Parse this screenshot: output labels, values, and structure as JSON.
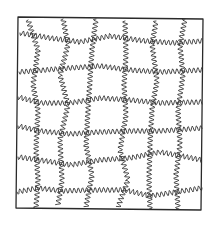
{
  "drawing": {
    "description": "Hand-drawn sketch: square frame filled with a distorted grid of wavy (squiggly) lines",
    "stroke_color": "#333333",
    "background": "#ffffff",
    "frame": {
      "points": [
        [
          18,
          17
        ],
        [
          203,
          19
        ],
        [
          201,
          210
        ],
        [
          16,
          208
        ]
      ]
    },
    "vertical_lines": [
      {
        "points": [
          [
            28,
            20
          ],
          [
            38,
            50
          ],
          [
            33,
            85
          ],
          [
            38,
            110
          ],
          [
            36,
            150
          ],
          [
            38,
            180
          ],
          [
            36,
            208
          ]
        ]
      },
      {
        "points": [
          [
            63,
            19
          ],
          [
            68,
            45
          ],
          [
            60,
            75
          ],
          [
            68,
            105
          ],
          [
            60,
            140
          ],
          [
            62,
            180
          ],
          [
            58,
            205
          ]
        ]
      },
      {
        "points": [
          [
            96,
            19
          ],
          [
            92,
            50
          ],
          [
            90,
            80
          ],
          [
            88,
            110
          ],
          [
            86,
            145
          ],
          [
            92,
            175
          ],
          [
            86,
            207
          ]
        ]
      },
      {
        "points": [
          [
            125,
            21
          ],
          [
            126,
            55
          ],
          [
            124,
            85
          ],
          [
            126,
            115
          ],
          [
            120,
            150
          ],
          [
            128,
            180
          ],
          [
            118,
            207
          ]
        ]
      },
      {
        "points": [
          [
            156,
            21
          ],
          [
            152,
            45
          ],
          [
            157,
            80
          ],
          [
            152,
            110
          ],
          [
            150,
            145
          ],
          [
            149,
            180
          ],
          [
            150,
            209
          ]
        ]
      },
      {
        "points": [
          [
            185,
            19
          ],
          [
            180,
            45
          ],
          [
            183,
            75
          ],
          [
            178,
            110
          ],
          [
            180,
            145
          ],
          [
            176,
            175
          ],
          [
            178,
            209
          ]
        ]
      }
    ],
    "horizontal_lines": [
      {
        "points": [
          [
            20,
            33
          ],
          [
            50,
            38
          ],
          [
            80,
            42
          ],
          [
            110,
            36
          ],
          [
            145,
            41
          ],
          [
            175,
            43
          ],
          [
            202,
            41
          ]
        ]
      },
      {
        "points": [
          [
            19,
            72
          ],
          [
            45,
            70
          ],
          [
            70,
            68
          ],
          [
            100,
            66
          ],
          [
            130,
            70
          ],
          [
            160,
            72
          ],
          [
            202,
            70
          ]
        ]
      },
      {
        "points": [
          [
            18,
            97
          ],
          [
            40,
            103
          ],
          [
            70,
            103
          ],
          [
            100,
            98
          ],
          [
            130,
            100
          ],
          [
            160,
            103
          ],
          [
            202,
            102
          ]
        ]
      },
      {
        "points": [
          [
            18,
            126
          ],
          [
            40,
            131
          ],
          [
            70,
            134
          ],
          [
            100,
            132
          ],
          [
            130,
            131
          ],
          [
            160,
            131
          ],
          [
            202,
            128
          ]
        ]
      },
      {
        "points": [
          [
            18,
            157
          ],
          [
            40,
            160
          ],
          [
            70,
            165
          ],
          [
            100,
            160
          ],
          [
            130,
            158
          ],
          [
            160,
            152
          ],
          [
            202,
            160
          ]
        ]
      },
      {
        "points": [
          [
            17,
            192
          ],
          [
            38,
            188
          ],
          [
            62,
            191
          ],
          [
            90,
            190
          ],
          [
            125,
            190
          ],
          [
            150,
            196
          ],
          [
            202,
            188
          ]
        ]
      }
    ],
    "wave_amplitude": 2.6,
    "wave_period": 4.2
  }
}
